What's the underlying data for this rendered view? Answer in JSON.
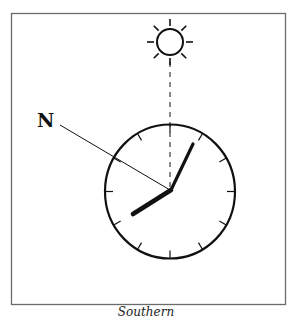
{
  "diagram": {
    "caption": "Southern",
    "north_label": "N",
    "sun_icon": "sun-icon",
    "clock": {
      "hour_hand_position": "8 o'clock",
      "minute_hand_position": "1 o'clock",
      "tick_count": 12
    },
    "colors": {
      "ink": "#111111",
      "frame": "#6b6b6b",
      "background": "#ffffff"
    }
  }
}
